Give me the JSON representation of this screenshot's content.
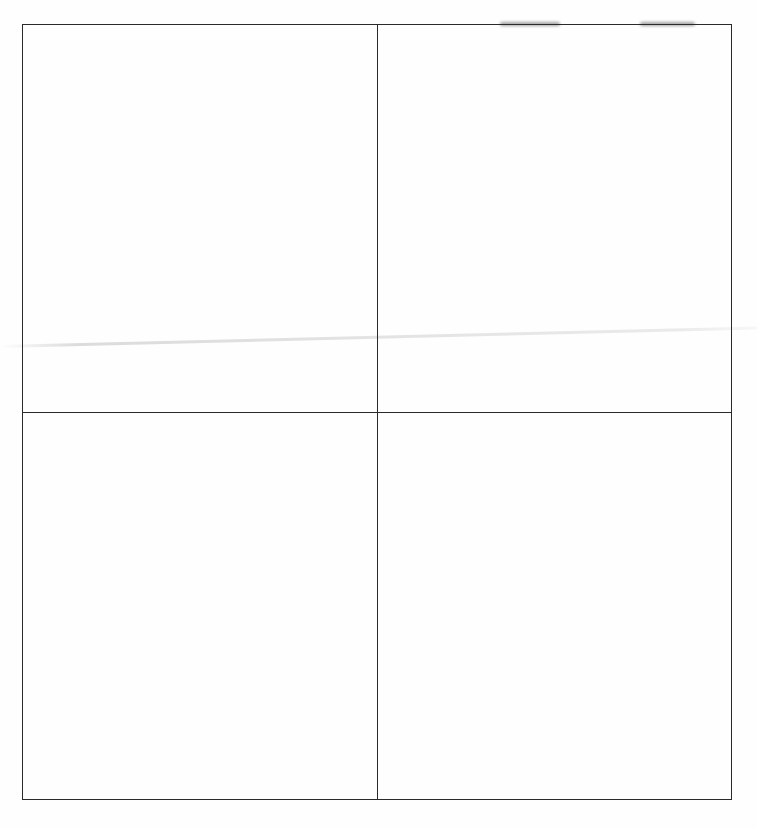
{
  "document": {
    "type": "blank-grid",
    "layout": {
      "rows": 2,
      "columns": 2
    },
    "cells": [
      {
        "row": 1,
        "column": 1,
        "text": ""
      },
      {
        "row": 1,
        "column": 2,
        "text": ""
      },
      {
        "row": 2,
        "column": 1,
        "text": ""
      },
      {
        "row": 2,
        "column": 2,
        "text": ""
      }
    ],
    "colors": {
      "background": "#fefefe",
      "line": "#2a2a2a"
    }
  }
}
